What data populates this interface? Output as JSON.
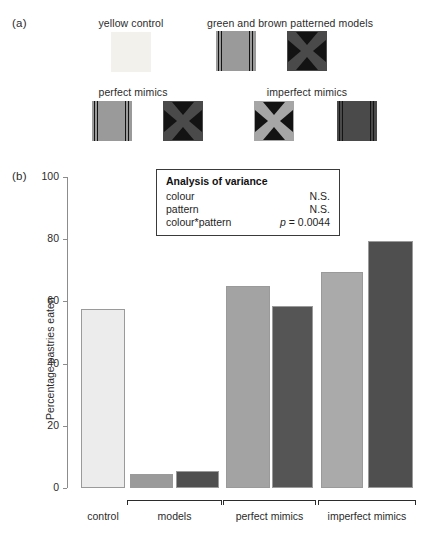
{
  "figure": {
    "panel_a_tag": "(a)",
    "panel_b_tag": "(b)"
  },
  "stimuli": {
    "groups": [
      {
        "title": "yellow control"
      },
      {
        "title": "green and brown patterned models"
      },
      {
        "title": "perfect mimics"
      },
      {
        "title": "imperfect mimics"
      }
    ],
    "swatches": [
      {
        "name": "yellow-control-swatch",
        "colour": "#f2f1ec",
        "pattern": "plain"
      },
      {
        "name": "green-lines-model-swatch",
        "colour": "#9a9a9a",
        "pattern": "lines"
      },
      {
        "name": "brown-cross-model-swatch",
        "colour": "#4a4a4a",
        "pattern": "cross"
      },
      {
        "name": "green-lines-perfect-mimic-swatch",
        "colour": "#9a9a9a",
        "pattern": "lines"
      },
      {
        "name": "brown-cross-perfect-mimic-swatch",
        "colour": "#4a4a4a",
        "pattern": "cross"
      },
      {
        "name": "green-cross-imperfect-mimic-swatch",
        "colour": "#a6a6a6",
        "pattern": "cross"
      },
      {
        "name": "brown-lines-imperfect-mimic-swatch",
        "colour": "#4a4a4a",
        "pattern": "lines"
      }
    ]
  },
  "anova": {
    "title": "Analysis of variance",
    "rows": [
      {
        "term": "colour",
        "value": "N.S."
      },
      {
        "term": "pattern",
        "value": "N.S."
      },
      {
        "term": "colour*pattern",
        "value_italic": "p",
        "value_rest": " = 0.0044"
      }
    ]
  },
  "chart_data": {
    "type": "bar",
    "title": "",
    "xlabel": "",
    "ylabel": "Percentage pastries eaten",
    "ylim": [
      0,
      100
    ],
    "yticks": [
      0,
      20,
      40,
      60,
      80,
      100
    ],
    "ytick_labels": [
      "0",
      "20",
      "40",
      "60",
      "80",
      "100"
    ],
    "grid": false,
    "legend": "none",
    "group_labels": [
      "control",
      "models",
      "perfect mimics",
      "imperfect mimics"
    ],
    "categories": [
      "yellow control",
      "green model",
      "brown model",
      "green perfect mimic",
      "brown perfect mimic",
      "green imperfect mimic",
      "brown imperfect mimic"
    ],
    "values": [
      57.5,
      4.5,
      5.5,
      65,
      58.5,
      69.5,
      79.5
    ],
    "bar_colours": [
      "#ececec",
      "#9a9a9a",
      "#4f4f4f",
      "#a3a3a3",
      "#555555",
      "#aaaaaa",
      "#4f4f4f"
    ],
    "groups": [
      {
        "label": "control",
        "bars": [
          0
        ],
        "bracket": false
      },
      {
        "label": "models",
        "bars": [
          1,
          2
        ],
        "bracket": true
      },
      {
        "label": "perfect mimics",
        "bars": [
          3,
          4
        ],
        "bracket": true
      },
      {
        "label": "imperfect mimics",
        "bars": [
          5,
          6
        ],
        "bracket": true
      }
    ]
  }
}
